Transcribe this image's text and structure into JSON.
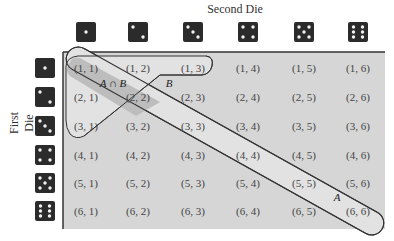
{
  "title": "Second Die",
  "ylabel": "First Die",
  "colors": {
    "background": "#ffffff",
    "panel": "#d6d6d6",
    "band_a": "#e2e2e2",
    "intersection": "#bdbdbd",
    "die": "#2b2b2b",
    "pip": "#f2f2f2",
    "outline": "#333333",
    "text": "#444444"
  },
  "columns": [
    1,
    2,
    3,
    4,
    5,
    6
  ],
  "rows": [
    1,
    2,
    3,
    4,
    5,
    6
  ],
  "cells": [
    [
      "(1, 1)",
      "(1, 2)",
      "(1, 3)",
      "(1, 4)",
      "(1, 5)",
      "(1, 6)"
    ],
    [
      "(2, 1)",
      "(2, 2)",
      "(2, 3)",
      "(2, 4)",
      "(2, 5)",
      "(2, 6)"
    ],
    [
      "(3, 1)",
      "(3, 2)",
      "(3, 3)",
      "(3, 4)",
      "(3, 5)",
      "(3, 6)"
    ],
    [
      "(4, 1)",
      "(4, 2)",
      "(4, 3)",
      "(4, 4)",
      "(4, 5)",
      "(4, 6)"
    ],
    [
      "(5, 1)",
      "(5, 2)",
      "(5, 3)",
      "(5, 4)",
      "(5, 5)",
      "(5, 6)"
    ],
    [
      "(6, 1)",
      "(6, 2)",
      "(6, 3)",
      "(6, 4)",
      "(6, 5)",
      "(6, 6)"
    ]
  ],
  "regions": {
    "A": {
      "label": "A",
      "description": "doubles: (1,1),(2,2),(3,3),(4,4),(5,5),(6,6)"
    },
    "B": {
      "label": "B",
      "description": "first row (1,1),(1,2),(1,3) plus first column (2,1),(3,1) band"
    },
    "A_and_B": {
      "label": "A ∩ B"
    }
  }
}
